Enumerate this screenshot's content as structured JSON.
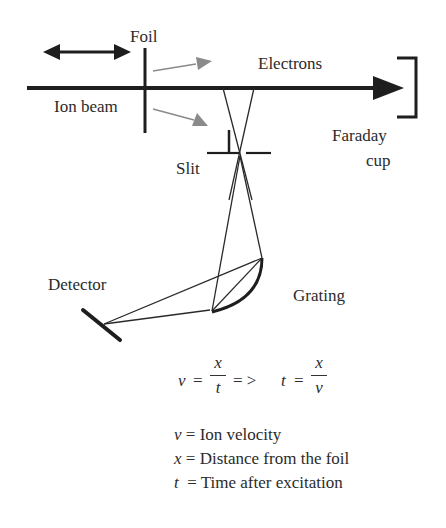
{
  "labels": {
    "foil": "Foil",
    "electrons": "Electrons",
    "ion_beam": "Ion beam",
    "faraday_line1": "Faraday",
    "faraday_line2": "cup",
    "slit": "Slit",
    "detector": "Detector",
    "grating": "Grating"
  },
  "equation": {
    "lhs_var": "v",
    "equals": "=",
    "frac1_num": "x",
    "frac1_den": "t",
    "implies": "= >",
    "rhs_var": "t",
    "equals2": "=",
    "frac2_num": "x",
    "frac2_den": "v"
  },
  "legend": [
    {
      "symbol": "v",
      "sep": " = ",
      "text": "Ion velocity"
    },
    {
      "symbol": "x",
      "sep": " = ",
      "text": "Distance from the foil"
    },
    {
      "symbol": "t",
      "sep": "  = ",
      "text": "Time after excitation"
    }
  ],
  "colors": {
    "line": "#1e1e1e",
    "electron_arrow": "#8a8a8a",
    "background": "#ffffff"
  }
}
